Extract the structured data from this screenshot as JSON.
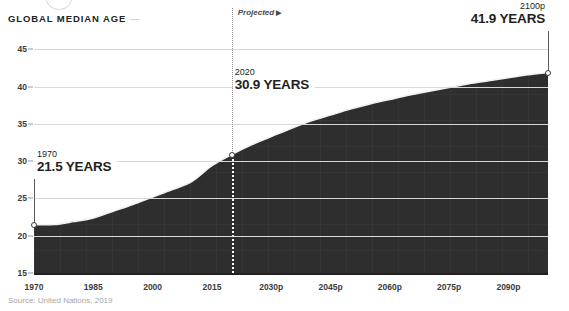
{
  "header": {
    "title": "GLOBAL MEDIAN AGE",
    "title_dash": "—"
  },
  "footer": {
    "source": "Source: United Nations, 2019"
  },
  "projected": {
    "label": "Projected",
    "arrow": "▶",
    "at_year": 2020
  },
  "annotations": [
    {
      "year_label": "1970",
      "value_label": "21.5 YEARS",
      "x_year": 1970,
      "y_value": 21.5
    },
    {
      "year_label": "2020",
      "value_label": "30.9 YEARS",
      "x_year": 2020,
      "y_value": 30.9
    },
    {
      "year_label": "2100p",
      "value_label": "41.9 YEARS",
      "x_year": 2100,
      "y_value": 41.9
    }
  ],
  "colors": {
    "area_fill": "#2e2e2e",
    "line": "#f2f2f2",
    "grid": "#d8d8d8",
    "axis": "#231f20",
    "text": "#231f20",
    "muted_text": "#a6a6a6",
    "projected_divider": "#8e8e8e"
  },
  "chart_data": {
    "type": "area",
    "title": "GLOBAL MEDIAN AGE",
    "subtitle": "",
    "xlabel": "",
    "ylabel": "",
    "xlim": [
      1970,
      2100
    ],
    "ylim": [
      15,
      46
    ],
    "grid": true,
    "legend": "none",
    "yticks": [
      15,
      20,
      25,
      30,
      35,
      40,
      45
    ],
    "ytick_labels": [
      "15",
      "20",
      "25",
      "30",
      "35",
      "40",
      "45"
    ],
    "xticks": [
      1970,
      1985,
      2000,
      2015,
      2030,
      2045,
      2060,
      2075,
      2090
    ],
    "xtick_labels": [
      "1970",
      "1985",
      "2000",
      "2015",
      "2030p",
      "2045p",
      "2060p",
      "2075p",
      "2090p"
    ],
    "series": [
      {
        "name": "Global median age",
        "unit": "years",
        "x": [
          1970,
          1975,
          1980,
          1985,
          1990,
          1995,
          2000,
          2005,
          2010,
          2015,
          2020,
          2025,
          2030,
          2035,
          2040,
          2045,
          2050,
          2055,
          2060,
          2065,
          2070,
          2075,
          2080,
          2085,
          2090,
          2095,
          2100
        ],
        "values": [
          21.5,
          21.5,
          21.9,
          22.4,
          23.3,
          24.2,
          25.2,
          26.2,
          27.3,
          29.4,
          30.9,
          32.2,
          33.3,
          34.4,
          35.4,
          36.2,
          37.0,
          37.7,
          38.3,
          38.9,
          39.4,
          39.9,
          40.4,
          40.8,
          41.2,
          41.6,
          41.9
        ]
      }
    ],
    "annotated_points": [
      {
        "x": 1970,
        "y": 21.5,
        "label": "21.5 YEARS"
      },
      {
        "x": 2020,
        "y": 30.9,
        "label": "30.9 YEARS"
      },
      {
        "x": 2100,
        "y": 41.9,
        "label": "41.9 YEARS"
      }
    ],
    "projection_start": 2020,
    "source": "Source: United Nations, 2019"
  }
}
